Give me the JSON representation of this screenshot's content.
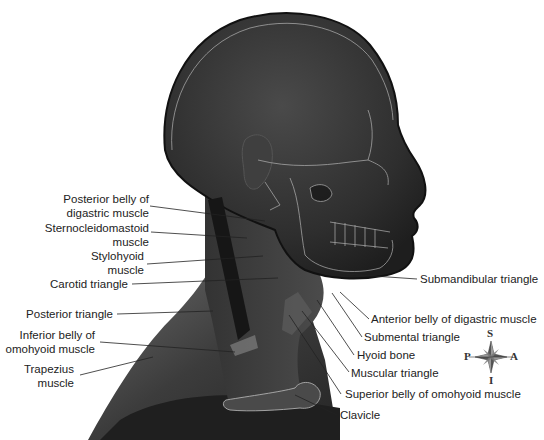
{
  "figure": {
    "background_color": "#ffffff",
    "skin_color": "#3a3a3a",
    "outline_color": "#c8c8c8"
  },
  "labels_left": [
    {
      "id": "posterior-belly-digastric",
      "lines": [
        "Posterior belly of",
        "digastric muscle"
      ]
    },
    {
      "id": "sternocleidomastoid",
      "lines": [
        "Sternocleidomastoid",
        "muscle"
      ]
    },
    {
      "id": "stylohyoid",
      "lines": [
        "Stylohyoid",
        "muscle"
      ]
    },
    {
      "id": "carotid-triangle",
      "lines": [
        "Carotid triangle"
      ]
    },
    {
      "id": "posterior-triangle",
      "lines": [
        "Posterior triangle"
      ]
    },
    {
      "id": "inferior-belly-omohyoid",
      "lines": [
        "Inferior belly of",
        "omohyoid muscle"
      ]
    },
    {
      "id": "trapezius",
      "lines": [
        "Trapezius",
        "muscle"
      ]
    }
  ],
  "labels_right": [
    {
      "id": "submandibular-triangle",
      "lines": [
        "Submandibular triangle"
      ]
    },
    {
      "id": "anterior-belly-digastric",
      "lines": [
        "Anterior belly of digastric muscle"
      ]
    },
    {
      "id": "submental-triangle",
      "lines": [
        "Submental triangle"
      ]
    },
    {
      "id": "hyoid-bone",
      "lines": [
        "Hyoid bone"
      ]
    },
    {
      "id": "muscular-triangle",
      "lines": [
        "Muscular triangle"
      ]
    },
    {
      "id": "superior-belly-omohyoid",
      "lines": [
        "Superior belly of omohyoid muscle"
      ]
    },
    {
      "id": "clavicle",
      "lines": [
        "Clavicle"
      ]
    }
  ],
  "compass": {
    "superior": "S",
    "inferior": "I",
    "posterior": "P",
    "anterior": "A"
  }
}
